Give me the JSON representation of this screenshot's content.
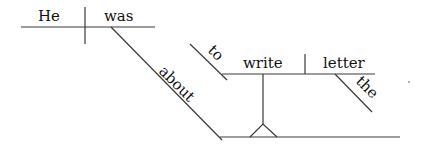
{
  "diagram": {
    "type": "Reed-Kellogg sentence diagram",
    "words": {
      "subject": "He",
      "verb": "was",
      "preposition": "about",
      "infinitive_marker": "to",
      "infinitive_verb": "write",
      "object": "letter",
      "article": "the"
    },
    "colors": {
      "line": "#3a3a3a",
      "text": "#111111",
      "background": "#ffffff"
    }
  }
}
